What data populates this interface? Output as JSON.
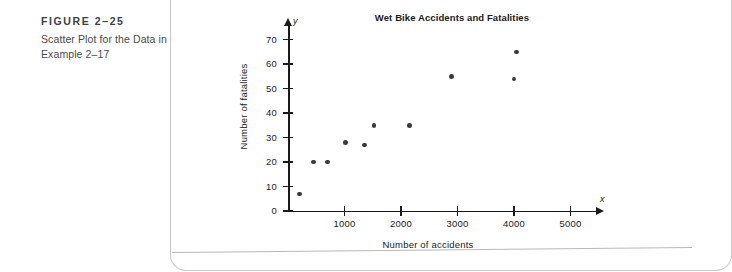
{
  "caption": {
    "figure_number": "FIGURE 2–25",
    "lines": [
      "Scatter Plot for the Data in",
      "Example 2–17"
    ]
  },
  "chart_data": {
    "type": "scatter",
    "title": "Wet Bike Accidents and Fatalities",
    "xlabel": "Number of accidents",
    "ylabel": "Number of fatalities",
    "x_var_symbol": "x",
    "y_var_symbol": "y",
    "xlim": [
      0,
      5400
    ],
    "ylim": [
      0,
      76
    ],
    "grid": false,
    "legend": null,
    "xticks": [
      1000,
      2000,
      3000,
      4000,
      5000
    ],
    "xtick_labels": [
      "1000",
      "2000",
      "3000",
      "4000",
      "5000"
    ],
    "yticks": [
      0,
      10,
      20,
      30,
      40,
      50,
      60,
      70
    ],
    "ytick_labels": [
      "0",
      "10",
      "20",
      "30",
      "40",
      "50",
      "60",
      "70"
    ],
    "marker_color": "#3b3b3b",
    "points": [
      {
        "x": 200,
        "y": 7
      },
      {
        "x": 450,
        "y": 20
      },
      {
        "x": 700,
        "y": 20
      },
      {
        "x": 1020,
        "y": 28
      },
      {
        "x": 1350,
        "y": 27
      },
      {
        "x": 1520,
        "y": 35
      },
      {
        "x": 2150,
        "y": 35
      },
      {
        "x": 2900,
        "y": 55
      },
      {
        "x": 4000,
        "y": 54
      },
      {
        "x": 4050,
        "y": 65
      }
    ]
  }
}
